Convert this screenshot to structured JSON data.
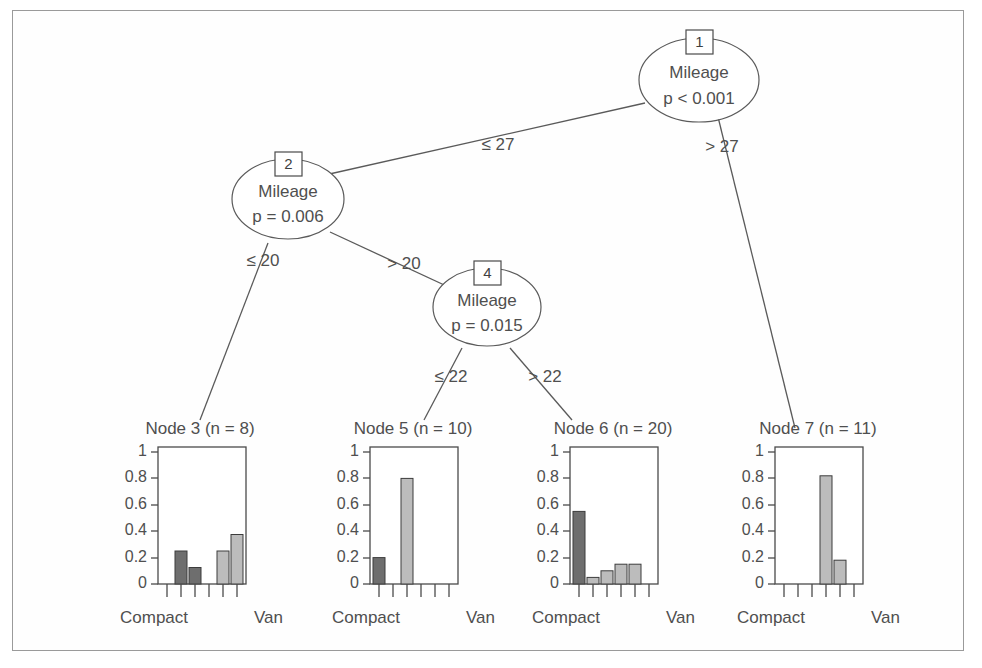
{
  "chart_data": {
    "type": "diagram",
    "response_categories": [
      "Compact",
      "",
      "",
      "",
      "",
      "Van"
    ],
    "n_categories": 6,
    "ylim": [
      0,
      1
    ],
    "y_ticks": [
      "0",
      "0.2",
      "0.4",
      "0.6",
      "0.8",
      "1"
    ],
    "x_label_left": "Compact",
    "x_label_right": "Van",
    "inner_nodes": [
      {
        "id": "1",
        "variable": "Mileage",
        "pvalue": "p < 0.001",
        "left_label": "≤ 27",
        "right_label": "> 27"
      },
      {
        "id": "2",
        "variable": "Mileage",
        "pvalue": "p = 0.006",
        "left_label": "≤ 20",
        "right_label": "> 20"
      },
      {
        "id": "4",
        "variable": "Mileage",
        "pvalue": "p = 0.015",
        "left_label": "≤ 22",
        "right_label": "> 22"
      }
    ],
    "leaf_nodes": [
      {
        "id": "3",
        "n": "8",
        "title": "Node 3 (n = 8)",
        "values": [
          0,
          0.25,
          0.125,
          0,
          0.25,
          0.375
        ]
      },
      {
        "id": "5",
        "n": "10",
        "title": "Node 5 (n = 10)",
        "values": [
          0.2,
          0,
          0.8,
          0,
          0,
          0
        ]
      },
      {
        "id": "6",
        "n": "20",
        "title": "Node 6 (n = 20)",
        "values": [
          0.55,
          0.05,
          0.1,
          0.15,
          0.15,
          0
        ]
      },
      {
        "id": "7",
        "n": "11",
        "title": "Node 7 (n = 11)",
        "values": [
          0,
          0,
          0,
          0.82,
          0.18,
          0
        ]
      }
    ]
  },
  "nodes": {
    "n1": {
      "id": "1",
      "variable": "Mileage",
      "pvalue": "p < 0.001"
    },
    "n2": {
      "id": "2",
      "variable": "Mileage",
      "pvalue": "p = 0.006"
    },
    "n4": {
      "id": "4",
      "variable": "Mileage",
      "pvalue": "p = 0.015"
    }
  },
  "edges": {
    "e1_left": "≤ 27",
    "e1_right": "> 27",
    "e2_left": "≤ 20",
    "e2_right": "> 20",
    "e4_left": "≤ 22",
    "e4_right": "> 22"
  },
  "leaves": {
    "l3": {
      "title": "Node 3 (n = 8)",
      "x_left": "Compact",
      "x_right": "Van",
      "y_ticks": [
        "1",
        "0.8",
        "0.6",
        "0.4",
        "0.2",
        "0"
      ]
    },
    "l5": {
      "title": "Node 5 (n = 10)",
      "x_left": "Compact",
      "x_right": "Van",
      "y_ticks": [
        "1",
        "0.8",
        "0.6",
        "0.4",
        "0.2",
        "0"
      ]
    },
    "l6": {
      "title": "Node 6 (n = 20)",
      "x_left": "Compact",
      "x_right": "Van",
      "y_ticks": [
        "1",
        "0.8",
        "0.6",
        "0.4",
        "0.2",
        "0"
      ]
    },
    "l7": {
      "title": "Node 7 (n = 11)",
      "x_left": "Compact",
      "x_right": "Van",
      "y_ticks": [
        "1",
        "0.8",
        "0.6",
        "0.4",
        "0.2",
        "0"
      ]
    }
  },
  "colors": {
    "bar_dark": "#6e6e6e",
    "bar_light": "#bcbcbc",
    "line": "#5a5a5a",
    "text": "#4f4f4f",
    "border": "#9a9a9a"
  }
}
